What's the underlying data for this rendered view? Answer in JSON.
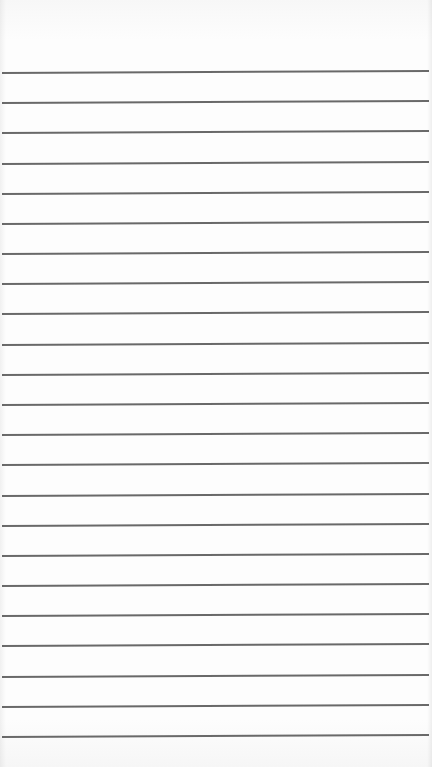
{
  "page": {
    "type": "lined-paper",
    "background_color": "#fcfcfc",
    "line_color": "#4f4f4f",
    "line_count": 23,
    "first_line_y": 72,
    "line_spacing": 30.18,
    "line_left_x": 2,
    "line_width": 427,
    "text_content": ""
  }
}
